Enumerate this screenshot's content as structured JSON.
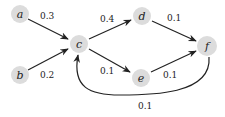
{
  "diagram": {
    "type": "directed-weighted-graph",
    "nodes": [
      {
        "id": "a",
        "label": "a",
        "x": 20,
        "y": 14
      },
      {
        "id": "b",
        "label": "b",
        "x": 20,
        "y": 75
      },
      {
        "id": "c",
        "label": "c",
        "x": 79,
        "y": 44
      },
      {
        "id": "d",
        "label": "d",
        "x": 142,
        "y": 16
      },
      {
        "id": "e",
        "label": "e",
        "x": 141,
        "y": 78
      },
      {
        "id": "f",
        "label": "f",
        "x": 207,
        "y": 46
      }
    ],
    "edges": [
      {
        "from": "a",
        "to": "c",
        "weight": "0.3"
      },
      {
        "from": "b",
        "to": "c",
        "weight": "0.2"
      },
      {
        "from": "c",
        "to": "d",
        "weight": "0.4"
      },
      {
        "from": "c",
        "to": "e",
        "weight": "0.1"
      },
      {
        "from": "d",
        "to": "f",
        "weight": "0.1"
      },
      {
        "from": "e",
        "to": "f",
        "weight": "0.1"
      },
      {
        "from": "f",
        "to": "c",
        "weight": "0.1",
        "curved": true
      }
    ]
  }
}
